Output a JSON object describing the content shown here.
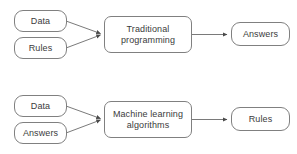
{
  "diagram": {
    "type": "flowchart",
    "background_color": "#ffffff",
    "stroke_color": "#808080",
    "arrow_color": "#6b6b6b",
    "text_color": "#3b3b3b",
    "rows": [
      {
        "id": "traditional-programming-row",
        "inputs": [
          {
            "id": "top-input-data",
            "label": "Data"
          },
          {
            "id": "top-input-rules",
            "label": "Rules"
          }
        ],
        "process": {
          "id": "top-process",
          "label": "Traditional\nprogramming"
        },
        "outputs": [
          {
            "id": "top-output-answers",
            "label": "Answers"
          }
        ]
      },
      {
        "id": "machine-learning-row",
        "inputs": [
          {
            "id": "bottom-input-data",
            "label": "Data"
          },
          {
            "id": "bottom-input-answers",
            "label": "Answers"
          }
        ],
        "process": {
          "id": "bottom-process",
          "label": "Machine learning\nalgorithms"
        },
        "outputs": [
          {
            "id": "bottom-output-rules",
            "label": "Rules"
          }
        ]
      }
    ]
  }
}
